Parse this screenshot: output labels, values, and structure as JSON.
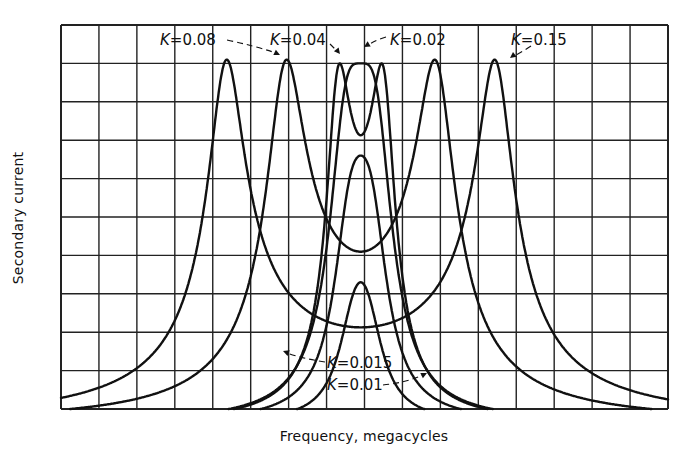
{
  "chart_data": {
    "type": "line",
    "title": "",
    "xlabel": "Frequency, megacycles",
    "ylabel": "Secondary current",
    "x_ticks": "none labeled (16 grid columns)",
    "y_ticks": "none labeled (10 grid rows)",
    "grid": true,
    "legend": "inline labels with dashed leader arrows",
    "xlim": [
      0,
      16
    ],
    "ylim": [
      0,
      10
    ],
    "center_frequency_col": 7.9,
    "series": [
      {
        "name": "K=0.15",
        "label": "K=0.15",
        "description": "double-humped, widest split",
        "peaks": [
          [
            4.4,
            9.45
          ],
          [
            11.45,
            9.45
          ]
        ],
        "center_dip": [
          7.9,
          5.6
        ],
        "points": [
          [
            4.0,
            0.0
          ],
          [
            4.1,
            4.0
          ],
          [
            4.15,
            7.5
          ],
          [
            4.2,
            8.8
          ],
          [
            4.5,
            9.4
          ],
          [
            4.9,
            9.45
          ],
          [
            5.3,
            9.2
          ],
          [
            6.0,
            7.9
          ],
          [
            6.8,
            6.6
          ],
          [
            7.4,
            5.9
          ],
          [
            7.9,
            5.6
          ],
          [
            8.4,
            5.9
          ],
          [
            9.0,
            6.6
          ],
          [
            9.8,
            7.9
          ],
          [
            10.5,
            9.2
          ],
          [
            11.0,
            9.45
          ],
          [
            11.4,
            9.4
          ],
          [
            11.65,
            8.8
          ],
          [
            11.75,
            7.5
          ],
          [
            11.8,
            4.0
          ],
          [
            11.9,
            0.0
          ]
        ]
      },
      {
        "name": "K=0.08",
        "label": "K=0.08",
        "peaks": [
          [
            5.95,
            9.45
          ],
          [
            9.85,
            9.45
          ]
        ],
        "center_dip": [
          7.9,
          7.55
        ]
      },
      {
        "name": "K=0.04",
        "label": "K=0.04",
        "peaks": [
          [
            7.35,
            9.35
          ],
          [
            8.45,
            9.35
          ]
        ],
        "center_dip": [
          7.9,
          9.1
        ]
      },
      {
        "name": "K=0.02",
        "label": "K=0.02",
        "description": "critical coupling, single flat peak",
        "peaks": [
          [
            7.9,
            9.35
          ]
        ]
      },
      {
        "name": "K=0.015",
        "label": "K=0.015",
        "peaks": [
          [
            7.9,
            6.95
          ]
        ]
      },
      {
        "name": "K=0.01",
        "label": "K=0.01",
        "peaks": [
          [
            7.9,
            3.65
          ]
        ]
      }
    ],
    "annotations": [
      "K=0.08",
      "K=0.04",
      "K=0.02",
      "K=0.15",
      "K=0.015",
      "K=0.01"
    ]
  },
  "labels": {
    "xlabel": "Frequency, megacycles",
    "ylabel": "Secondary current",
    "k008": "K=0.08",
    "k004": "K=0.04",
    "k002": "K=0.02",
    "k015": "K=0.15",
    "k0015": "K=0.015",
    "k001": "K=0.01"
  },
  "style": {
    "line_color": "#111111",
    "grid_color": "#222222",
    "background": "#ffffff"
  }
}
